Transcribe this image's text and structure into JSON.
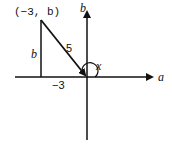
{
  "diagram": {
    "type": "coordinate-plane-triangle",
    "axes": {
      "horizontal_label": "a",
      "vertical_label": "b"
    },
    "point": {
      "label": "(−3, b)",
      "x": -3,
      "y": "b"
    },
    "side_labels": {
      "vertical_leg": "b",
      "hypotenuse": "5",
      "horizontal": "−3"
    },
    "angle_label": "x",
    "colors": {
      "stroke": "#111111",
      "background": "#ffffff"
    }
  }
}
